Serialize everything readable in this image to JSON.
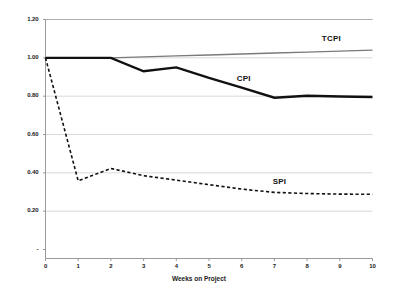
{
  "chart_data": {
    "type": "line",
    "title": "",
    "subtitle": "",
    "xlabel": "Weeks on Project",
    "ylabel": "",
    "x": [
      0,
      1,
      2,
      3,
      4,
      5,
      6,
      7,
      8,
      9,
      10
    ],
    "xlim": [
      0,
      10
    ],
    "ylim": [
      0,
      1.2
    ],
    "grid": "horizontal",
    "legend_position": "inline-annotations",
    "x_tick_labels": [
      "0",
      "1",
      "2",
      "3",
      "4",
      "5",
      "6",
      "7",
      "8",
      "9",
      "10"
    ],
    "y_tick_labels": [
      "-",
      "0.20",
      "0.40",
      "0.60",
      "0.80",
      "1.00",
      "1.20"
    ],
    "y_tick_values": [
      0,
      0.2,
      0.4,
      0.6,
      0.8,
      1.0,
      1.2
    ],
    "series": [
      {
        "name": "TCPI",
        "label": "TCPI",
        "color": "#7a7a7a",
        "style": "solid",
        "width": 1.4,
        "values": [
          1.0,
          1.0,
          1.0,
          1.005,
          1.01,
          1.015,
          1.02,
          1.025,
          1.03,
          1.035,
          1.04
        ],
        "label_x": 8.45,
        "label_y": 1.1
      },
      {
        "name": "CPI",
        "label": "CPI",
        "color": "#111111",
        "style": "solid",
        "width": 2.4,
        "values": [
          1.0,
          1.0,
          1.0,
          0.93,
          0.95,
          0.895,
          0.845,
          0.792,
          0.802,
          0.798,
          0.796
        ],
        "label_x": 5.85,
        "label_y": 0.888
      },
      {
        "name": "SPI",
        "label": "SPI",
        "color": "#111111",
        "style": "dashed",
        "width": 1.6,
        "values": [
          1.0,
          0.358,
          0.423,
          0.385,
          0.362,
          0.338,
          0.315,
          0.298,
          0.292,
          0.289,
          0.288
        ],
        "label_x": 6.95,
        "label_y": 0.352
      }
    ],
    "annotations": [
      {
        "text": "TCPI",
        "series": "TCPI"
      },
      {
        "text": "CPI",
        "series": "CPI"
      },
      {
        "text": "SPI",
        "series": "SPI"
      }
    ]
  }
}
